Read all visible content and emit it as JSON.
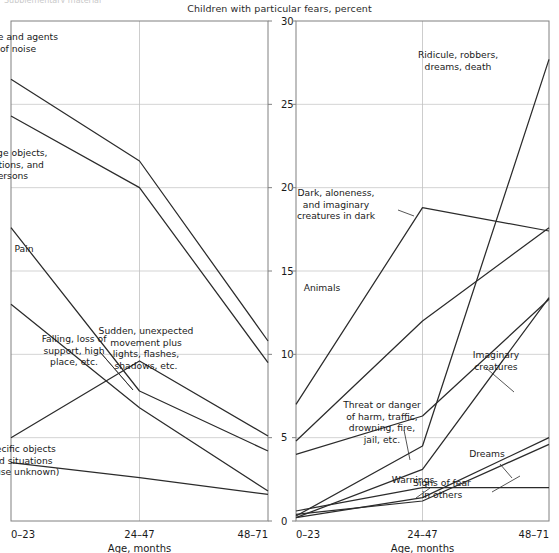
{
  "figure": {
    "cut_off_header": "Supplementary material",
    "title": "Children with particular fears, percent",
    "xlabel": "Age, months",
    "x_categories": [
      "0–23",
      "24–47",
      "48–71"
    ],
    "y_ticks": [
      0,
      5,
      10,
      15,
      20,
      25,
      30
    ],
    "ylim": [
      0,
      30
    ],
    "line_color": "#2b2b2b",
    "grid_color": "#c8c8c8"
  },
  "chart_data": [
    {
      "type": "line",
      "panel": "left",
      "title": "Children with particular fears, percent",
      "xlabel": "Age, months",
      "ylabel": "",
      "categories": [
        "0–23",
        "24–47",
        "48–71"
      ],
      "ylim": [
        0,
        30
      ],
      "yticks": [
        0,
        5,
        10,
        15,
        20,
        25,
        30
      ],
      "grid": true,
      "legend": "inline-labels",
      "series": [
        {
          "name": "Noise and agents of noise",
          "values": [
            26.5,
            21.6,
            10.8
          ],
          "label": "Noise and agents\nof noise",
          "label_x": 18,
          "label_y": 40,
          "leader": false
        },
        {
          "name": "Strange objects, situations, and persons",
          "values": [
            24.3,
            20.0,
            9.5
          ],
          "label": "Strange objects,\nsituations, and\npersons",
          "label_x": 10,
          "label_y": 156,
          "leader": false
        },
        {
          "name": "Pain",
          "values": [
            17.6,
            7.8,
            4.2
          ],
          "label": "Pain",
          "label_x": 24,
          "label_y": 252,
          "leader": false
        },
        {
          "name": "Falling, loss of support, high place, etc.",
          "values": [
            13.0,
            6.8,
            1.8
          ],
          "label": "Falling, loss of\nsupport, high\nplace, etc.",
          "label_x": 74,
          "label_y": 342,
          "leader": true
        },
        {
          "name": "Sudden, unexpected movement plus lights, flashes, shadows, etc.",
          "values": [
            5.0,
            9.6,
            5.1
          ],
          "label": "Sudden, unexpected\nmovement plus\nlights, flashes,\nshadows, etc.",
          "label_x": 146,
          "label_y": 334,
          "leader": false
        },
        {
          "name": "Specific objects and situations (cause unknown)",
          "values": [
            3.5,
            2.6,
            1.6
          ],
          "label": "Specific objects\nand situations\n(cause unknown)",
          "label_x": 20,
          "label_y": 452,
          "leader": false
        }
      ]
    },
    {
      "type": "line",
      "panel": "right",
      "title": "Children with particular fears, percent",
      "xlabel": "Age, months",
      "ylabel": "",
      "categories": [
        "0–23",
        "24–47",
        "48–71"
      ],
      "ylim": [
        0,
        30
      ],
      "yticks": [
        0,
        5,
        10,
        15,
        20,
        25,
        30
      ],
      "grid": true,
      "legend": "inline-labels",
      "series": [
        {
          "name": "Ridicule, robbers, dreams, death",
          "values": [
            0.3,
            4.5,
            27.7
          ],
          "label": "Ridicule, robbers,\ndreams, death",
          "label_x": 458,
          "label_y": 58,
          "leader": false
        },
        {
          "name": "Dark, aloneness, and imaginary creatures in dark",
          "values": [
            7.0,
            18.8,
            17.4
          ],
          "label": "Dark, aloneness,\nand imaginary\ncreatures in dark",
          "label_x": 336,
          "label_y": 196,
          "leader": true
        },
        {
          "name": "Animals",
          "values": [
            4.8,
            12.0,
            17.6
          ],
          "label": "Animals",
          "label_x": 322,
          "label_y": 291,
          "leader": false
        },
        {
          "name": "Imaginary creatures",
          "values": [
            0.2,
            3.1,
            13.4
          ],
          "label": "Imaginary\ncreatures",
          "label_x": 496,
          "label_y": 358,
          "leader": true
        },
        {
          "name": "Threat or danger of harm, traffic, drowning, fire, jail, etc.",
          "values": [
            4.0,
            6.3,
            13.3
          ],
          "label": "Threat or danger\nof harm, traffic,\ndrowning, fire,\njail, etc.",
          "label_x": 382,
          "label_y": 408,
          "leader": true
        },
        {
          "name": "Dreams",
          "values": [
            0.2,
            1.4,
            5.0
          ],
          "label": "Dreams",
          "label_x": 487,
          "label_y": 457,
          "leader": true
        },
        {
          "name": "Signs of fear in others",
          "values": [
            0.4,
            1.2,
            4.6
          ],
          "label": "Signs of fear\nin others",
          "label_x": 442,
          "label_y": 486,
          "leader": true
        },
        {
          "name": "Warnings",
          "values": [
            0.6,
            2.0,
            2.0
          ],
          "label": "Warnings",
          "label_x": 413,
          "label_y": 483,
          "leader": true
        }
      ]
    }
  ]
}
